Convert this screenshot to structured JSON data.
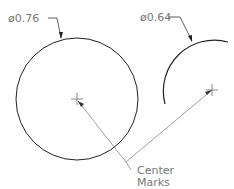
{
  "drawing": {
    "circle_large": {
      "label": "ø0.76",
      "cx": 77,
      "cy": 99,
      "r": 61
    },
    "arc_small": {
      "label": "ø0.64",
      "cx": 212,
      "cy": 90,
      "r": 51
    },
    "callout": {
      "line1": "Center",
      "line2": "Marks"
    },
    "colors": {
      "stroke": "#222222",
      "leader": "#777777",
      "text": "#777777"
    }
  }
}
